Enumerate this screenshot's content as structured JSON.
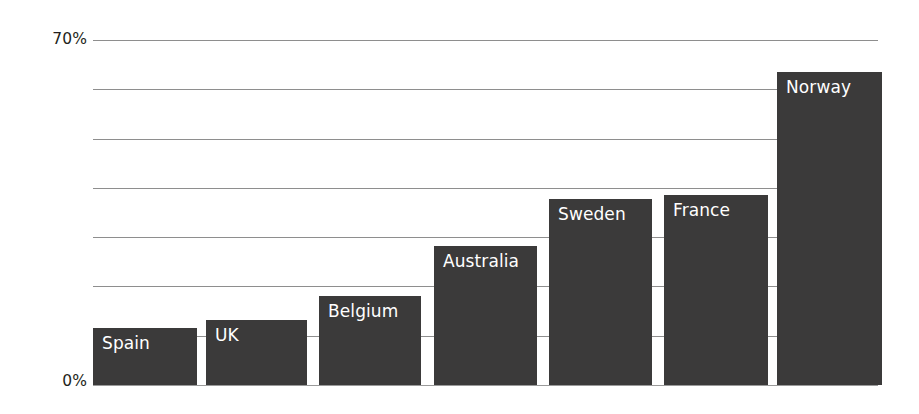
{
  "chart_data": {
    "type": "bar",
    "title": "",
    "subtitle": "",
    "xlabel": "",
    "ylabel": "",
    "categories": [
      "Spain",
      "UK",
      "Belgium",
      "Australia",
      "Sweden",
      "France",
      "Norway"
    ],
    "values": [
      11.6,
      13.2,
      18.1,
      28.2,
      37.7,
      38.6,
      63.5
    ],
    "unit": "%",
    "ylim": [
      0,
      70
    ],
    "yticks": [
      0,
      70
    ],
    "ytick_labels": [
      "0%",
      "70%"
    ],
    "gridlines": [
      0,
      10,
      20,
      30,
      40,
      50,
      60,
      70
    ],
    "grid": true,
    "legend": false,
    "legend_position": "none",
    "bar_labels_inside": true,
    "series": [
      {
        "name": "Share",
        "color": "#3b3a3a",
        "values": [
          11.6,
          13.2,
          18.1,
          28.2,
          37.7,
          38.6,
          63.5
        ]
      }
    ]
  },
  "axis": {
    "y_top_label": "70%",
    "y_bottom_label": "0%"
  },
  "bars": [
    {
      "label": "Spain",
      "value": 11.6,
      "left": 93,
      "width": 104
    },
    {
      "label": "UK",
      "value": 13.2,
      "left": 206,
      "width": 101
    },
    {
      "label": "Belgium",
      "value": 18.1,
      "left": 319,
      "width": 102
    },
    {
      "label": "Australia",
      "value": 28.2,
      "left": 434,
      "width": 103
    },
    {
      "label": "Sweden",
      "value": 37.7,
      "left": 549,
      "width": 103
    },
    {
      "label": "France",
      "value": 38.6,
      "left": 664,
      "width": 104
    },
    {
      "label": "Norway",
      "value": 63.5,
      "left": 777,
      "width": 105
    }
  ],
  "style": {
    "bar_color": "#3b3a3a",
    "grid_color": "#8e8e8e",
    "label_color": "#ffffff",
    "axis_text_color": "#231f20",
    "background": "#ffffff"
  }
}
